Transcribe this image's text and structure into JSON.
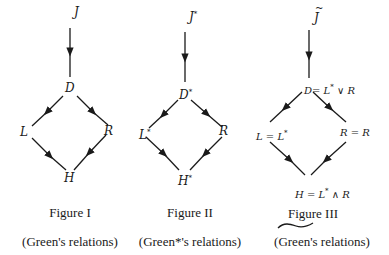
{
  "figures": [
    {
      "title": "Figure I",
      "subtitle": "(Green's relations)",
      "nodes": {
        "top": "J",
        "top_mark": "",
        "d": "D",
        "d_sup": "",
        "l": "L",
        "l_sup": "",
        "r": "R",
        "h": "H",
        "h_sup": ""
      }
    },
    {
      "title": "Figure II",
      "subtitle": "(Green*'s relations)",
      "nodes": {
        "top": "J",
        "top_sup": "*",
        "d": "D",
        "d_sup": "*",
        "l": "L",
        "l_sup": "*",
        "r": "R",
        "h": "H",
        "h_sup": "*"
      }
    },
    {
      "title": "Figure III",
      "subtitle": "(Green's relations)",
      "subtitle_mark": "tilde over \"(Green\"",
      "nodes": {
        "top": "J",
        "top_mark": "~",
        "d": "D",
        "d_eq": "= L",
        "d_sup": "*",
        "d_rest": " ∨ R",
        "l": "L = L",
        "l_sup": "*",
        "r": "R = R",
        "h": "H = L",
        "h_sup": "*",
        "h_rest": " ∧ R"
      }
    }
  ],
  "colors": {
    "ink": "#1a1a1a",
    "background": "#ffffff"
  }
}
